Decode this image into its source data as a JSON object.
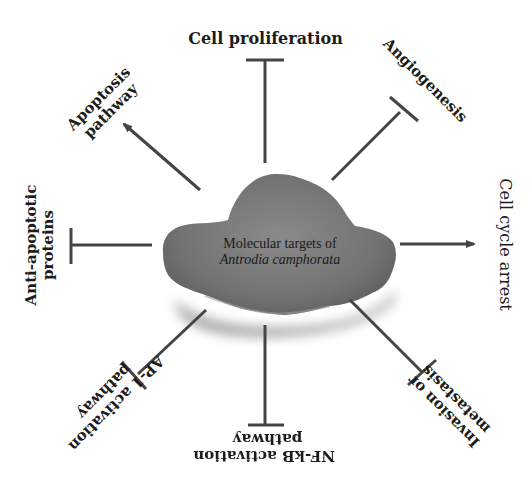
{
  "diagram": {
    "center": {
      "line1": "Molecular targets of",
      "line2": "Antrodia camphorata",
      "image": "mushroom-fragment (gray)"
    },
    "nodes": [
      {
        "id": "cell-proliferation",
        "lines": [
          "Cell proliferation"
        ],
        "relation": "inhibits",
        "position": "top"
      },
      {
        "id": "angiogenesis",
        "lines": [
          "Angiogenesis"
        ],
        "relation": "inhibits",
        "position": "top-right"
      },
      {
        "id": "cell-cycle-arrest",
        "lines": [
          "Cell cycle arrest"
        ],
        "relation": "activates",
        "position": "right"
      },
      {
        "id": "invasion-metastasis",
        "lines": [
          "Invasion or",
          "metastasis"
        ],
        "relation": "inhibits",
        "position": "bottom-right"
      },
      {
        "id": "nfkb-pathway",
        "lines": [
          "NF-kB activation",
          "pathway"
        ],
        "relation": "inhibits",
        "position": "bottom"
      },
      {
        "id": "ap1-pathway",
        "lines": [
          "AP-1 activation",
          "pathway"
        ],
        "relation": "inhibits",
        "position": "bottom-left"
      },
      {
        "id": "anti-apoptotic",
        "lines": [
          "Anti-apoptotic",
          "proteins"
        ],
        "relation": "inhibits",
        "position": "left"
      },
      {
        "id": "apoptosis-pathway",
        "lines": [
          "Apoptosis",
          "pathway"
        ],
        "relation": "activates",
        "position": "top-left"
      }
    ],
    "colors": {
      "connector": "#444444",
      "text": "#1c1c1c",
      "mushroom": "#7a7a7a",
      "background": "#ffffff"
    }
  }
}
